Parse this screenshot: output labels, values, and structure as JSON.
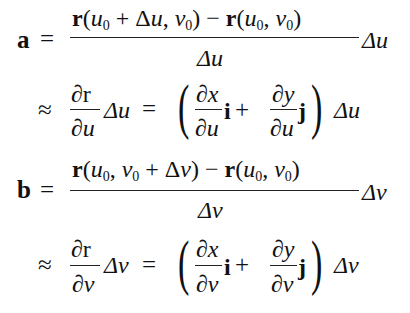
{
  "equations": [
    {
      "id": "a",
      "lhs": "a",
      "relation": "=",
      "numerator": {
        "r1": "r",
        "open1": "(",
        "u1": "u",
        "u1sub": "0",
        "plus": "+",
        "delta": "Δ",
        "dvar": "u",
        "comma1": ",",
        "v1": "v",
        "v1sub": "0",
        "close1": ")",
        "minus": "−",
        "r2": "r",
        "open2": "(",
        "u2": "u",
        "u2sub": "0",
        "comma2": ",",
        "v2": "v",
        "v2sub": "0",
        "close2": ")"
      },
      "denominator": "Δu",
      "factor": "Δu"
    },
    {
      "id": "a-approx",
      "relation": "≈",
      "partial_num": "∂r",
      "partial_den": "∂u",
      "factor1": "Δu",
      "equals": "=",
      "open_paren": "(",
      "term1_num": "∂x",
      "term1_den": "∂u",
      "unit1": "i",
      "plus": "+",
      "term2_num": "∂y",
      "term2_den": "∂u",
      "unit2": "j",
      "close_paren": ")",
      "factor2": "Δu"
    },
    {
      "id": "b",
      "lhs": "b",
      "relation": "=",
      "numerator": {
        "r1": "r",
        "open1": "(",
        "u1": "u",
        "u1sub": "0",
        "comma1": ",",
        "v1": "v",
        "v1sub": "0",
        "plus": "+",
        "delta": "Δ",
        "dvar": "v",
        "close1": ")",
        "minus": "−",
        "r2": "r",
        "open2": "(",
        "u2": "u",
        "u2sub": "0",
        "comma2": ",",
        "v2": "v",
        "v2sub": "0",
        "close2": ")"
      },
      "denominator": "Δv",
      "factor": "Δv"
    },
    {
      "id": "b-approx",
      "relation": "≈",
      "partial_num": "∂r",
      "partial_den": "∂v",
      "factor1": "Δv",
      "equals": "=",
      "open_paren": "(",
      "term1_num": "∂x",
      "term1_den": "∂v",
      "unit1": "i",
      "plus": "+",
      "term2_num": "∂y",
      "term2_den": "∂v",
      "unit2": "j",
      "close_paren": ")",
      "factor2": "Δv"
    }
  ]
}
